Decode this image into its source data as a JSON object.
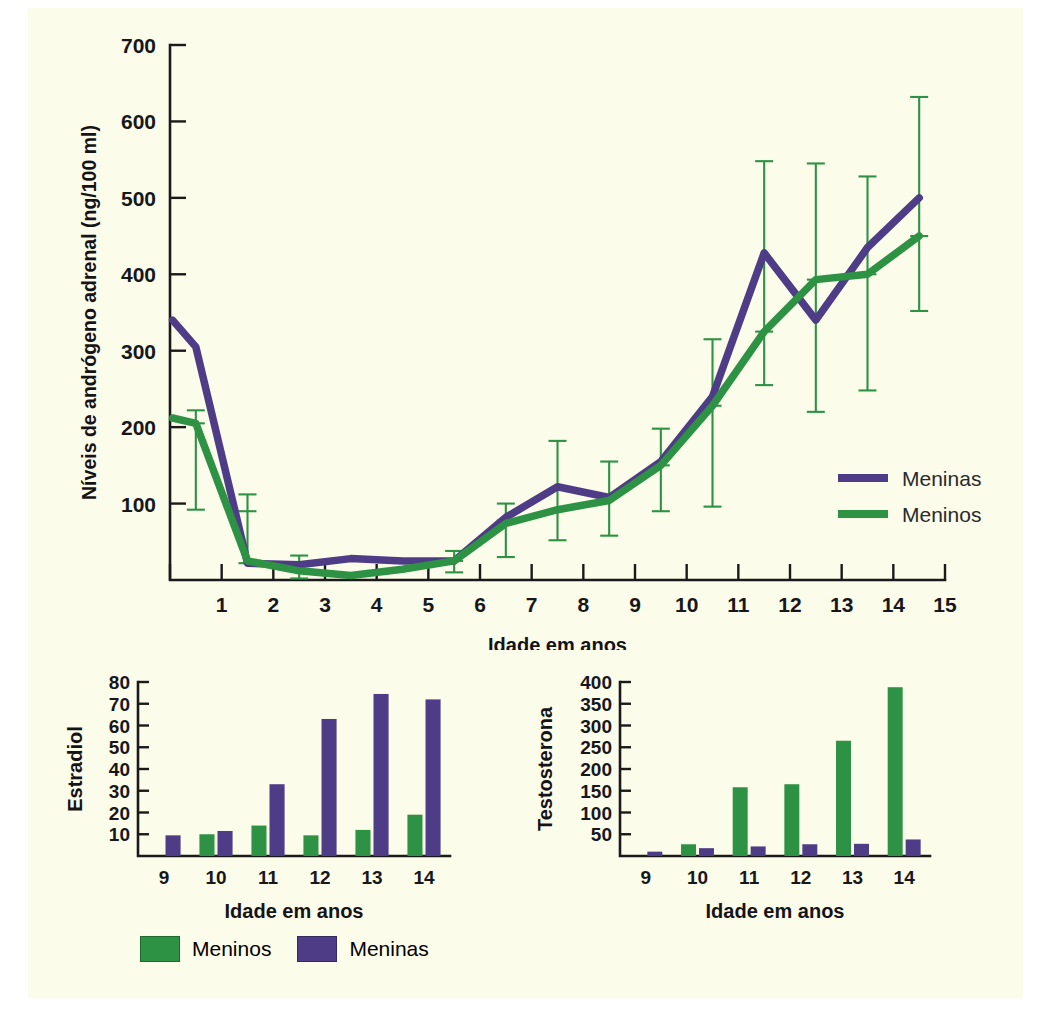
{
  "page": {
    "background_color": "#fcfcea",
    "colors": {
      "girls": "#4e3c86",
      "boys": "#2e9245",
      "axis": "#17171a"
    }
  },
  "chart_data": [
    {
      "id": "adrenal-androgen-line",
      "type": "line",
      "title": "",
      "xlabel": "Idade em anos",
      "ylabel": "Níveis de andrógeno adrenal (ng/100 ml)",
      "xlim": [
        0,
        15
      ],
      "ylim": [
        0,
        700
      ],
      "xticks": [
        0,
        1,
        2,
        3,
        4,
        5,
        6,
        7,
        8,
        9,
        10,
        11,
        12,
        13,
        14,
        15
      ],
      "xticklabels": [
        "",
        "1",
        "2",
        "3",
        "4",
        "5",
        "6",
        "7",
        "8",
        "9",
        "10",
        "11",
        "12",
        "13",
        "14",
        "15"
      ],
      "yticks": [
        0,
        100,
        200,
        300,
        400,
        500,
        600,
        700
      ],
      "yticklabels": [
        "",
        "100",
        "200",
        "300",
        "400",
        "500",
        "600",
        "700"
      ],
      "grid": false,
      "legend_position": "inside-right",
      "legend": [
        "Meninas",
        "Meninos"
      ],
      "x": [
        0.05,
        0.5,
        1.5,
        2.5,
        3.5,
        4.5,
        5.5,
        6.5,
        7.5,
        8.5,
        9.5,
        10.5,
        11.5,
        12.5,
        13.5,
        14.5
      ],
      "series": [
        {
          "name": "Meninas",
          "color": "#4e3c86",
          "values": [
            340,
            305,
            78,
            22,
            25,
            28,
            25,
            28,
            80,
            122,
            108,
            155,
            240,
            428,
            340,
            393,
            435,
            500
          ]
        },
        {
          "name": "Meninos",
          "color": "#2e9245",
          "values": [
            210,
            205,
            90,
            25,
            18,
            8,
            12,
            22,
            72,
            95,
            105,
            150,
            225,
            325,
            393,
            400,
            450
          ]
        }
      ],
      "meninas_points": [
        {
          "x": 0.05,
          "y": 340
        },
        {
          "x": 0.5,
          "y": 305
        },
        {
          "x": 1.5,
          "y": 22
        },
        {
          "x": 2.5,
          "y": 20
        },
        {
          "x": 3.5,
          "y": 28
        },
        {
          "x": 4.5,
          "y": 25
        },
        {
          "x": 5.5,
          "y": 25
        },
        {
          "x": 6.5,
          "y": 82
        },
        {
          "x": 7.5,
          "y": 122
        },
        {
          "x": 8.5,
          "y": 108
        },
        {
          "x": 9.5,
          "y": 155
        },
        {
          "x": 10.5,
          "y": 240
        },
        {
          "x": 11.5,
          "y": 428
        },
        {
          "x": 12.5,
          "y": 340
        },
        {
          "x": 13.5,
          "y": 435
        },
        {
          "x": 14.5,
          "y": 500
        }
      ],
      "meninos_points": [
        {
          "x": 0.05,
          "y": 212
        },
        {
          "x": 0.5,
          "y": 205
        },
        {
          "x": 1.5,
          "y": 25
        },
        {
          "x": 2.5,
          "y": 12
        },
        {
          "x": 3.5,
          "y": 6
        },
        {
          "x": 4.5,
          "y": 14
        },
        {
          "x": 5.5,
          "y": 25
        },
        {
          "x": 6.5,
          "y": 74
        },
        {
          "x": 7.5,
          "y": 92
        },
        {
          "x": 8.5,
          "y": 104
        },
        {
          "x": 9.5,
          "y": 150
        },
        {
          "x": 10.5,
          "y": 228
        },
        {
          "x": 11.5,
          "y": 325
        },
        {
          "x": 12.5,
          "y": 393
        },
        {
          "x": 13.5,
          "y": 400
        },
        {
          "x": 14.5,
          "y": 450
        }
      ],
      "error_bars": [
        {
          "x": 0.5,
          "center": 205,
          "low": 92,
          "high": 222,
          "color": "#2e9245"
        },
        {
          "x": 1.5,
          "center": 90,
          "low": 22,
          "high": 112,
          "color": "#2e9245"
        },
        {
          "x": 2.5,
          "center": 22,
          "low": 2,
          "high": 32,
          "color": "#2e9245"
        },
        {
          "x": 5.5,
          "center": 25,
          "low": 10,
          "high": 38,
          "color": "#2e9245"
        },
        {
          "x": 6.5,
          "center": 78,
          "low": 30,
          "high": 100,
          "color": "#2e9245"
        },
        {
          "x": 7.5,
          "center": 118,
          "low": 52,
          "high": 182,
          "color": "#2e9245"
        },
        {
          "x": 8.5,
          "center": 108,
          "low": 58,
          "high": 155,
          "color": "#2e9245"
        },
        {
          "x": 9.5,
          "center": 150,
          "low": 90,
          "high": 198,
          "color": "#2e9245"
        },
        {
          "x": 10.5,
          "center": 228,
          "low": 96,
          "high": 315,
          "color": "#2e9245"
        },
        {
          "x": 11.5,
          "center": 325,
          "low": 255,
          "high": 548,
          "color": "#2e9245"
        },
        {
          "x": 12.5,
          "center": 393,
          "low": 220,
          "high": 545,
          "color": "#2e9245"
        },
        {
          "x": 13.5,
          "center": 400,
          "low": 248,
          "high": 528,
          "color": "#2e9245"
        },
        {
          "x": 14.5,
          "center": 450,
          "low": 352,
          "high": 632,
          "color": "#2e9245"
        }
      ]
    },
    {
      "id": "estradiol-bar",
      "type": "bar",
      "title": "",
      "xlabel": "Idade em anos",
      "ylabel": "Estradiol",
      "categories": [
        "9",
        "10",
        "11",
        "12",
        "13",
        "14"
      ],
      "ylim": [
        0,
        80
      ],
      "yticks": [
        10,
        20,
        30,
        40,
        50,
        60,
        70,
        80
      ],
      "yticklabels": [
        "10",
        "20",
        "30",
        "40",
        "50",
        "60",
        "70",
        "80"
      ],
      "grid": false,
      "series": [
        {
          "name": "Meninos",
          "color": "#2e9245",
          "values": [
            0,
            10,
            14,
            9.5,
            12,
            19
          ]
        },
        {
          "name": "Meninas",
          "color": "#4e3c86",
          "values": [
            9.5,
            11.5,
            33,
            63,
            74.5,
            72
          ]
        }
      ]
    },
    {
      "id": "testosterona-bar",
      "type": "bar",
      "title": "",
      "xlabel": "Idade em anos",
      "ylabel": "Testosterona",
      "categories": [
        "9",
        "10",
        "11",
        "12",
        "13",
        "14"
      ],
      "ylim": [
        0,
        400
      ],
      "yticks": [
        50,
        100,
        150,
        200,
        250,
        300,
        350,
        400
      ],
      "yticklabels": [
        "50",
        "100",
        "150",
        "200",
        "250",
        "300",
        "350",
        "400"
      ],
      "grid": false,
      "series": [
        {
          "name": "Meninos",
          "color": "#2e9245",
          "values": [
            0,
            27,
            158,
            165,
            265,
            388
          ]
        },
        {
          "name": "Meninas",
          "color": "#4e3c86",
          "values": [
            10,
            18,
            22,
            27,
            28,
            38
          ]
        }
      ]
    }
  ],
  "line_legend": {
    "items": [
      {
        "label": "Meninas",
        "color": "#4e3c86"
      },
      {
        "label": "Meninos",
        "color": "#2e9245"
      }
    ]
  },
  "bottom_legend": {
    "items": [
      {
        "label": "Meninos",
        "color": "#2e9245"
      },
      {
        "label": "Meninas",
        "color": "#4e3c86"
      }
    ]
  },
  "labels": {
    "idade_em_anos": "Idade em anos",
    "androgen_axis": "Níveis de andrógeno adrenal (ng/100 ml)",
    "estradiol_axis": "Estradiol",
    "testosterona_axis": "Testosterona"
  }
}
